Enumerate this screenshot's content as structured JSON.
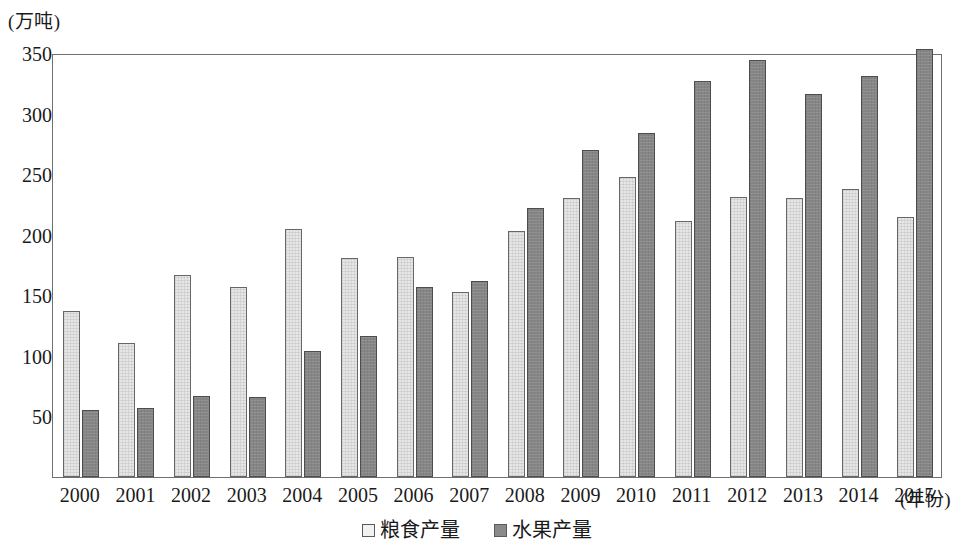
{
  "chart_data": {
    "type": "bar",
    "title": "",
    "subtitle": "",
    "xlabel": "(年份)",
    "ylabel": "(万吨)",
    "ylim": [
      0,
      350
    ],
    "ytick_step": 50,
    "yticks": [
      50,
      100,
      150,
      200,
      250,
      300,
      350
    ],
    "grid": false,
    "legend_position": "bottom-center",
    "categories": [
      "2000",
      "2001",
      "2002",
      "2003",
      "2004",
      "2005",
      "2006",
      "2007",
      "2008",
      "2009",
      "2010",
      "2011",
      "2012",
      "2013",
      "2014",
      "2015"
    ],
    "series": [
      {
        "name": "粮食产量",
        "color": "#e6e6e6",
        "values": [
          137,
          111,
          167,
          157,
          205,
          181,
          182,
          153,
          203,
          230,
          248,
          211,
          231,
          230,
          238,
          215
        ]
      },
      {
        "name": "水果产量",
        "color": "#868686",
        "values": [
          55,
          57,
          67,
          66,
          104,
          116,
          157,
          162,
          222,
          270,
          284,
          327,
          344,
          316,
          331,
          353
        ]
      }
    ]
  },
  "axis": {
    "y_unit_caption": "(万吨)",
    "x_axis_caption": "(年份)"
  },
  "legend": {
    "items": [
      {
        "label": "粮食产量",
        "swatch": "light"
      },
      {
        "label": "水果产量",
        "swatch": "dark"
      }
    ]
  }
}
